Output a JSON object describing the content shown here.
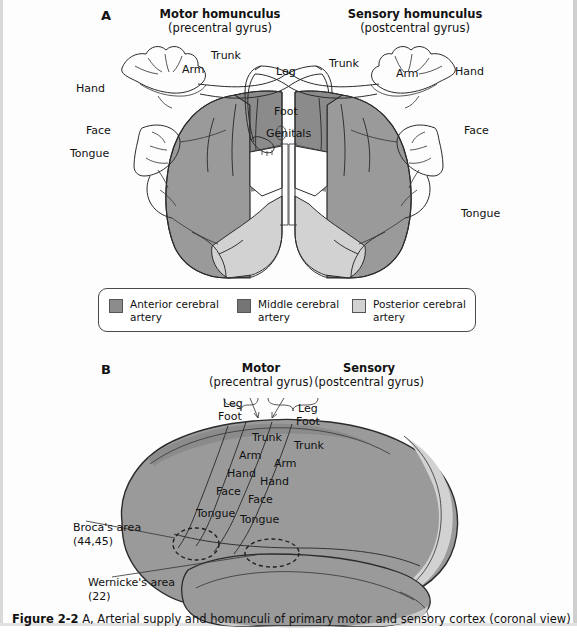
{
  "figure": {
    "panel_a_letter": "A",
    "panel_b_letter": "B",
    "caption_prefix": "Figure 2-2",
    "caption_text": "A, Arterial supply and homunculi of primary motor and sensory cortex (coronal view)"
  },
  "panel_a": {
    "motor_title": "Motor homunculus",
    "motor_subtitle": "(precentral gyrus)",
    "sensory_title": "Sensory homunculus",
    "sensory_subtitle": "(postcentral gyrus)",
    "left_labels": {
      "hand": "Hand",
      "arm": "Arm",
      "trunk": "Trunk",
      "face": "Face",
      "tongue": "Tongue",
      "leg": "Leg",
      "foot": "Foot",
      "genitals": "Genitals"
    },
    "right_labels": {
      "trunk": "Trunk",
      "arm": "Arm",
      "hand": "Hand",
      "face": "Face",
      "tongue": "Tongue",
      "leg": "Leg",
      "foot": "Foot"
    }
  },
  "legend": {
    "items": [
      {
        "label": "Anterior cerebral artery",
        "color": "#8c8c8c"
      },
      {
        "label": "Middle cerebral artery",
        "color": "#757575"
      },
      {
        "label": "Posterior cerebral artery",
        "color": "#d2d2d2"
      }
    ]
  },
  "panel_b": {
    "motor_title": "Motor",
    "motor_subtitle": "(precentral gyrus)",
    "sensory_title": "Sensory",
    "sensory_subtitle": "(postcentral gyrus)",
    "motor_top": {
      "leg": "Leg",
      "foot": "Foot"
    },
    "sensory_top": {
      "leg": "Leg",
      "foot": "Foot"
    },
    "motor_strip": [
      "Trunk",
      "Arm",
      "Hand",
      "Face",
      "Tongue"
    ],
    "sensory_strip": [
      "Trunk",
      "Arm",
      "Hand",
      "Face",
      "Tongue"
    ],
    "brocas_label": "Broca's area",
    "brocas_number": "(44,45)",
    "wernickes_label": "Wernicke's area",
    "wernickes_number": "(22)"
  },
  "colors": {
    "anterior": "#8c8c8c",
    "middle": "#757575",
    "posterior": "#d2d2d2",
    "outline": "#2b2b2b",
    "brain_mid": "#9a9a9a",
    "brain_light": "#c9c9c9"
  }
}
